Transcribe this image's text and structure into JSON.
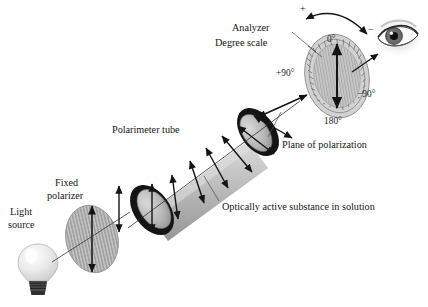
{
  "figure": {
    "background_color": "#ffffff"
  },
  "labels": {
    "light_source_line1": "Light",
    "light_source_line2": "source",
    "fixed_polarizer_line1": "Fixed",
    "fixed_polarizer_line2": "polarizer",
    "polarimeter_tube": "Polarimeter tube",
    "optically_active": "Optically active substance in solution",
    "analyzer": "Analyzer",
    "degree_scale": "Degree scale",
    "plane_of_polarization": "Plane of polarization"
  },
  "scale": {
    "zero": "0°",
    "plus_ninety": "+90°",
    "minus_ninety": "−90°",
    "one_eighty": "180°",
    "plus_sign": "+",
    "minus_sign": "−"
  },
  "colors": {
    "ink": "#161616",
    "tube_glass": "#b9b9b9",
    "tube_cap": "#1a1a1a",
    "polarizer_fill": "#b5b5b5",
    "dial_face": "#cfcfcf",
    "bulb_glass": "#ededed",
    "bulb_base": "#3a3a3a",
    "arrow": "#141414",
    "leader": "#4a4a4a"
  },
  "components": [
    {
      "name": "light-source",
      "label": "Light source"
    },
    {
      "name": "fixed-polarizer",
      "label": "Fixed polarizer"
    },
    {
      "name": "polarimeter-tube",
      "label": "Polarimeter tube"
    },
    {
      "name": "sample",
      "label": "Optically active substance in solution"
    },
    {
      "name": "analyzer",
      "label": "Analyzer"
    },
    {
      "name": "degree-scale",
      "label": "Degree scale"
    },
    {
      "name": "observer-eye",
      "label": "Eye"
    }
  ]
}
